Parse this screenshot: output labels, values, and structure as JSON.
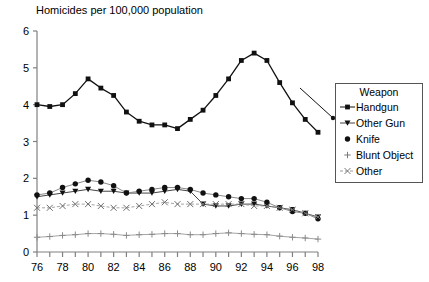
{
  "chart_data": {
    "type": "line",
    "title": "Homicides per 100,000 population",
    "xlabel": "",
    "ylabel": "",
    "ylim": [
      0,
      6
    ],
    "yticks": [
      0,
      1,
      2,
      3,
      4,
      5,
      6
    ],
    "ytick_labels": [
      "0",
      "1",
      "2",
      "3",
      "4",
      "5",
      "6"
    ],
    "xlim": [
      76,
      98
    ],
    "x": [
      76,
      77,
      78,
      79,
      80,
      81,
      82,
      83,
      84,
      85,
      86,
      87,
      88,
      89,
      90,
      91,
      92,
      93,
      94,
      95,
      96,
      97,
      98
    ],
    "xticks": [
      76,
      77,
      78,
      79,
      80,
      81,
      82,
      83,
      84,
      85,
      86,
      87,
      88,
      89,
      90,
      91,
      92,
      93,
      94,
      95,
      96,
      97,
      98
    ],
    "xtick_labels": [
      "76",
      "",
      "78",
      "",
      "80",
      "",
      "82",
      "",
      "84",
      "",
      "86",
      "",
      "88",
      "",
      "90",
      "",
      "92",
      "",
      "94",
      "",
      "96",
      "",
      "98"
    ],
    "grid": false,
    "legend_position": "right",
    "legend_title": "Weapon",
    "series": [
      {
        "name": "Handgun",
        "marker": "square",
        "values": [
          4.0,
          3.95,
          4.0,
          4.3,
          4.7,
          4.45,
          4.25,
          3.8,
          3.55,
          3.45,
          3.45,
          3.35,
          3.6,
          3.85,
          4.25,
          4.7,
          5.2,
          5.4,
          5.2,
          4.6,
          4.05,
          3.6,
          3.25
        ]
      },
      {
        "name": "Other Gun",
        "marker": "triangle",
        "values": [
          1.5,
          1.55,
          1.6,
          1.65,
          1.7,
          1.65,
          1.65,
          1.6,
          1.6,
          1.6,
          1.65,
          1.7,
          1.65,
          1.3,
          1.25,
          1.25,
          1.3,
          1.3,
          1.25,
          1.2,
          1.15,
          1.05,
          0.95
        ]
      },
      {
        "name": "Knife",
        "marker": "circle",
        "values": [
          1.55,
          1.6,
          1.75,
          1.85,
          1.95,
          1.9,
          1.8,
          1.6,
          1.65,
          1.7,
          1.75,
          1.75,
          1.7,
          1.6,
          1.55,
          1.5,
          1.45,
          1.45,
          1.35,
          1.2,
          1.1,
          1.05,
          0.9
        ]
      },
      {
        "name": "Blunt Object",
        "marker": "plus",
        "values": [
          0.4,
          0.42,
          0.45,
          0.47,
          0.5,
          0.5,
          0.48,
          0.45,
          0.47,
          0.48,
          0.5,
          0.5,
          0.47,
          0.47,
          0.5,
          0.52,
          0.5,
          0.48,
          0.47,
          0.43,
          0.4,
          0.38,
          0.35
        ]
      },
      {
        "name": "Other",
        "marker": "cross",
        "values": [
          1.2,
          1.2,
          1.25,
          1.3,
          1.3,
          1.25,
          1.2,
          1.2,
          1.25,
          1.3,
          1.35,
          1.3,
          1.3,
          1.3,
          1.3,
          1.3,
          1.3,
          1.25,
          1.25,
          1.2,
          1.15,
          1.05,
          0.95
        ]
      }
    ]
  },
  "legend": {
    "title": "Weapon",
    "items": [
      {
        "label": "Handgun"
      },
      {
        "label": "Other Gun"
      },
      {
        "label": "Knife"
      },
      {
        "label": "Blunt Object"
      },
      {
        "label": "Other"
      }
    ]
  }
}
